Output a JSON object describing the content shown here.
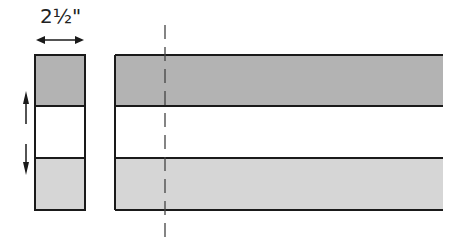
{
  "diagram": {
    "measurement_label": "2½\"",
    "colors": {
      "dark_fabric": "#b3b3b3",
      "light_fabric": "#d6d6d6",
      "middle_fabric": "#ffffff",
      "outline": "#1a1a1a",
      "cut_line": "#444444"
    },
    "segment": {
      "description": "Cut segment rotated, with arrows indicating strips",
      "x": 35,
      "y": 55,
      "width": 50,
      "height": 155,
      "bands": [
        {
          "name": "top",
          "fill": "dark"
        },
        {
          "name": "middle",
          "fill": "white"
        },
        {
          "name": "bottom",
          "fill": "light"
        }
      ]
    },
    "strip_set": {
      "description": "Three-strip set with dashed cutting line",
      "x": 115,
      "y": 55,
      "width": 328,
      "height": 155
    },
    "cut_line_x": 165
  }
}
